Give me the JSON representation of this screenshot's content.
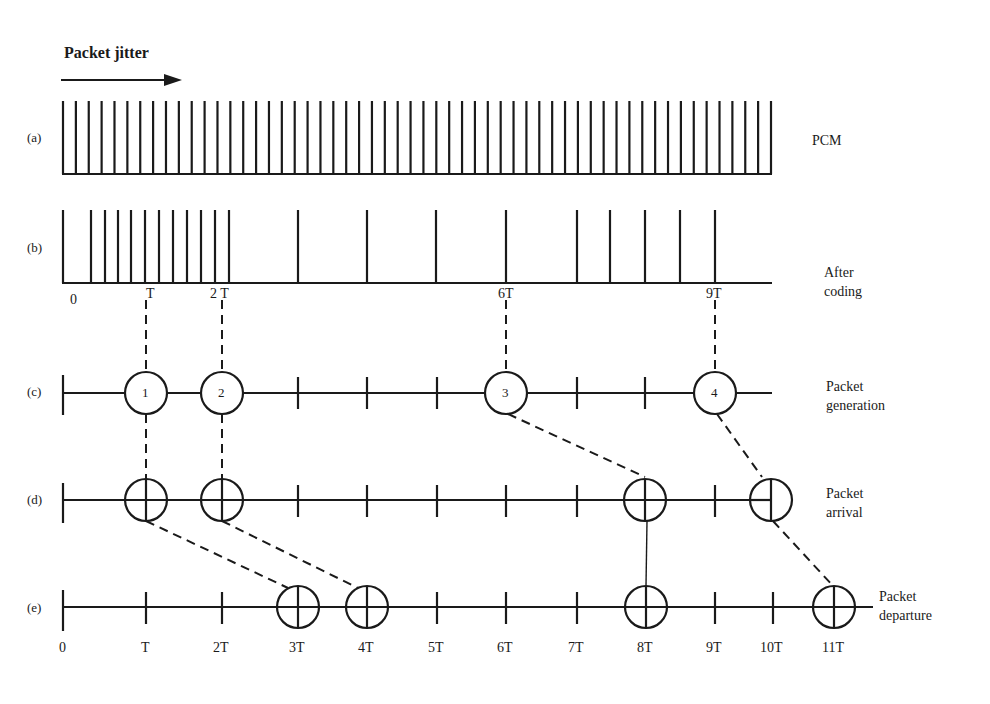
{
  "title": "Packet jitter",
  "colors": {
    "ink": "#1a1a1a",
    "background": "#ffffff"
  },
  "rows": {
    "a": {
      "label": "(a)",
      "name": "PCM"
    },
    "b": {
      "label": "(b)",
      "name_line1": "After",
      "name_line2": "coding"
    },
    "c": {
      "label": "(c)",
      "name_line1": "Packet",
      "name_line2": "generation"
    },
    "d": {
      "label": "(d)",
      "name_line1": "Packet",
      "name_line2": "arrival"
    },
    "e": {
      "label": "(e)",
      "name_line1": "Packet",
      "name_line2": "departure"
    }
  },
  "b_axis_labels": {
    "t0": "0",
    "t1": "T",
    "t2": "2 T",
    "t6": "6T",
    "t9": "9T"
  },
  "packets": [
    {
      "id": "1",
      "generated": "T",
      "arrival": "T",
      "departure": "3T"
    },
    {
      "id": "2",
      "generated": "2T",
      "arrival": "2T",
      "departure": "4T"
    },
    {
      "id": "3",
      "generated": "6T",
      "arrival": "8T",
      "departure": "8T"
    },
    {
      "id": "4",
      "generated": "9T",
      "arrival": "10T",
      "departure": "11T"
    }
  ],
  "axis_ticks": [
    "0",
    "T",
    "2T",
    "3T",
    "4T",
    "5T",
    "6T",
    "7T",
    "8T",
    "9T",
    "10T",
    "11T"
  ],
  "pcm_pulse_count": 56,
  "coded_pulse_count": 21
}
